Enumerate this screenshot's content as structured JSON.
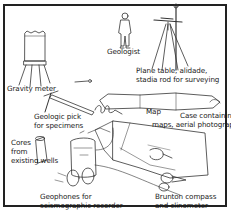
{
  "figure": {
    "labels": {
      "geologist": "Geologist",
      "plane_table_l1": "Plane table, alidade,",
      "plane_table_l2": "stadia rod for surveying",
      "gravity_meter": "Gravity meter",
      "map": "Map",
      "case_l1": "Case containing",
      "case_l2": "maps, aerial photographs",
      "pick_l1": "Geologic pick",
      "pick_l2": "for specimens",
      "cores_l1": "Cores",
      "cores_l2": "from",
      "cores_l3": "existing wells",
      "geophones_l1": "Geophones for",
      "geophones_l2": "seismographic recorder",
      "brunton_l1": "Brunton compass",
      "brunton_l2": "and clinometer"
    },
    "colors": {
      "ink": "#222222",
      "background": "#ffffff"
    }
  }
}
